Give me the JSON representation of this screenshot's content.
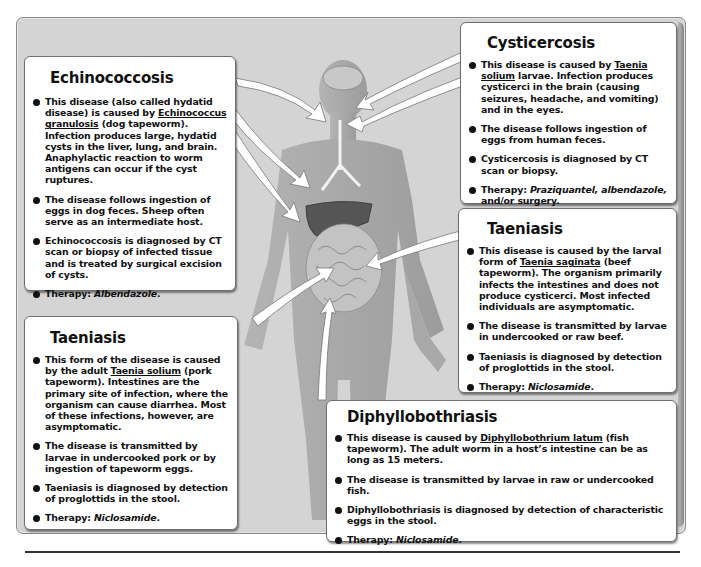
{
  "figure": {
    "type": "medical-infographic"
  },
  "callouts": {
    "echinococcosis": {
      "title": "Echinococcosis",
      "bullets": [
        {
          "pre": "This disease (also called hydatid disease) is caused by ",
          "organism": "Echinococcus granulosis",
          "post": " (dog tapeworm). Infection produces large, hydatid cysts in the liver, lung, and brain. Anaphylactic reaction to worm antigens can occur if the cyst ruptures."
        },
        {
          "text": "The disease follows ingestion of eggs in dog feces. Sheep often serve as an intermediate host."
        },
        {
          "text": "Echinococcosis is diagnosed by CT scan or biopsy of infected tissue and is treated by surgical excision of cysts."
        },
        {
          "label": "Therapy: ",
          "drug": "Albendazole",
          "post": "."
        }
      ]
    },
    "cysticercosis": {
      "title": "Cysticercosis",
      "bullets": [
        {
          "pre": "This disease is caused by ",
          "organism": "Taenia solium",
          "post": " larvae. Infection produces cysticerci in the brain (causing seizures, headache, and vomiting) and in the eyes."
        },
        {
          "text": "The disease follows ingestion of eggs from human feces."
        },
        {
          "text": "Cysticercosis is diagnosed by CT scan or biopsy."
        },
        {
          "label": "Therapy: ",
          "drug": "Praziquantel, albendazole,",
          "post": " and/or surgery."
        }
      ]
    },
    "taeniasis_beef": {
      "title": "Taeniasis",
      "bullets": [
        {
          "pre": "This disease is caused by the larval form of ",
          "organism": "Taenia saginata",
          "post": " (beef tapeworm). The organism primarily infects the intestines and does not produce cysticerci. Most infected individuals are asymptomatic."
        },
        {
          "text": "The disease is transmitted by larvae in undercooked or raw beef."
        },
        {
          "text": "Taeniasis is diagnosed by detection of proglottids in the stool."
        },
        {
          "label": "Therapy: ",
          "drug": "Niclosamide",
          "post": "."
        }
      ]
    },
    "taeniasis_pork": {
      "title": "Taeniasis",
      "bullets": [
        {
          "pre": "This form of the disease is caused by the adult ",
          "organism": "Taenia solium",
          "post": " (pork tapeworm). Intestines are the primary site of infection, where the organism can cause diarrhea. Most of these infections, however, are asymptomatic."
        },
        {
          "text": "The disease is transmitted by larvae in undercooked pork or by ingestion of tapeworm eggs."
        },
        {
          "text": "Taeniasis is diagnosed by detection of proglottids in the stool."
        },
        {
          "label": "Therapy: ",
          "drug": "Niclosamide",
          "post": "."
        }
      ]
    },
    "diphyllobothriasis": {
      "title": "Diphyllobothriasis",
      "bullets": [
        {
          "pre": "This disease is caused by ",
          "organism": "Diphyllobothrium latum",
          "post": " (fish tapeworm). The adult worm in a host’s intestine can be as long as 15 meters."
        },
        {
          "text": "The disease is transmitted by larvae in raw or undercooked fish."
        },
        {
          "text": "Diphyllobothriasis is diagnosed by detection of characteristic eggs in the stool."
        },
        {
          "label": "Therapy: ",
          "drug": "Niclosamide",
          "post": "."
        }
      ]
    }
  },
  "colors": {
    "background_panel": "#d4d4d4",
    "body_silhouette": "#a9a9a9",
    "liver": "#555555",
    "intestines": "#bdbdbd",
    "callout_fill": "#ffffff",
    "arrow_fill": "#ffffff"
  }
}
